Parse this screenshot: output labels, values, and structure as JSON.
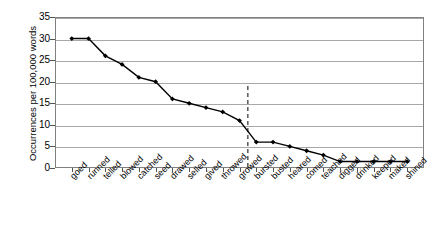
{
  "chart_data": {
    "type": "line",
    "title": "",
    "xlabel": "",
    "ylabel": "Occurrences per 100,000 words",
    "ylim": [
      0,
      35
    ],
    "yticks": [
      0,
      5,
      10,
      15,
      20,
      25,
      30,
      35
    ],
    "grid": true,
    "legend": null,
    "categories": [
      "goed",
      "runned",
      "telled",
      "blowed",
      "catched",
      "seed",
      "drawed",
      "selled",
      "gived",
      "throwed",
      "growed",
      "bursted",
      "busted",
      "heared",
      "comed",
      "teached",
      "digged",
      "drinked",
      "keeped",
      "maked",
      "shined"
    ],
    "values": [
      30,
      30,
      26,
      24,
      21,
      20,
      16,
      15,
      14,
      13,
      11,
      6,
      6,
      5,
      4,
      3,
      1.5,
      1.5,
      1.5,
      1.5,
      1.5
    ],
    "annotations": [
      {
        "type": "vertical-dashed-line",
        "name": "divider-dashed-line",
        "after_category": "growed",
        "between": [
          "growed",
          "bursted"
        ],
        "style": "dashed",
        "color": "#000000"
      }
    ],
    "marker": "filled-diamond",
    "line_color": "#000000",
    "marker_color": "#000000"
  },
  "axes": {
    "y_tick_labels": [
      "35",
      "30",
      "25",
      "20",
      "15",
      "10",
      "5",
      "0"
    ],
    "y_axis_title": "Occurrences per 100,000 words"
  }
}
